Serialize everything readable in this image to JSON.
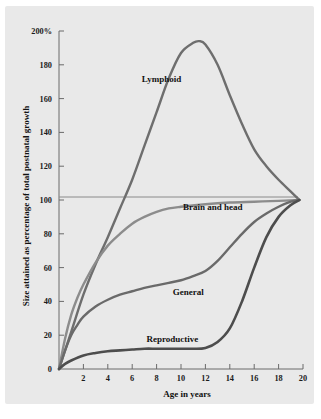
{
  "figure": {
    "background_color": "#e9e9e9",
    "axis_color": "#6a6a6a",
    "reference_line_value": 100
  },
  "chart_data": {
    "type": "line",
    "title": "",
    "xlabel": "Age in years",
    "ylabel": "Size attained as percentage of total postnatal growth",
    "xlim": [
      0,
      20
    ],
    "ylim": [
      0,
      200
    ],
    "grid": false,
    "legend_position": "inline-labels",
    "x_tick_labels": [
      "2",
      "4",
      "6",
      "8",
      "10",
      "12",
      "14",
      "16",
      "18",
      "20"
    ],
    "x_tick_values": [
      2,
      4,
      6,
      8,
      10,
      12,
      14,
      16,
      18,
      20
    ],
    "y_tick_labels": [
      "0",
      "20",
      "40",
      "60",
      "80",
      "100",
      "120",
      "140",
      "160",
      "180",
      "200%"
    ],
    "y_tick_values": [
      0,
      20,
      40,
      60,
      80,
      100,
      120,
      140,
      160,
      180,
      200
    ],
    "annotations": [
      {
        "text": "Lymphoid",
        "x": 8.4,
        "y": 170
      },
      {
        "text": "Brain and head",
        "x": 12.6,
        "y": 94
      },
      {
        "text": "General",
        "x": 10.6,
        "y": 44
      },
      {
        "text": "Reproductive",
        "x": 9.3,
        "y": 16
      }
    ],
    "series": [
      {
        "name": "Lymphoid",
        "color": "#6e6e6e",
        "x": [
          0,
          1,
          2,
          3,
          4,
          5,
          6,
          7,
          8,
          9,
          10,
          11,
          11.5,
          12,
          13,
          14,
          15,
          16,
          17,
          18,
          19,
          19.7
        ],
        "values": [
          0,
          22,
          44,
          62,
          78,
          95,
          112,
          132,
          152,
          172,
          187,
          193,
          194,
          192,
          180,
          162,
          145,
          130,
          120,
          112,
          105,
          100
        ]
      },
      {
        "name": "Brain and head",
        "color": "#8c8c8c",
        "x": [
          0,
          0.5,
          1,
          1.5,
          2,
          3,
          4,
          5,
          6,
          7,
          8,
          9,
          10,
          12,
          14,
          16,
          18,
          19.7
        ],
        "values": [
          0,
          18,
          32,
          42,
          50,
          63,
          73,
          80,
          86,
          90,
          93,
          95,
          96,
          97.5,
          98.5,
          99,
          99.5,
          100
        ]
      },
      {
        "name": "General",
        "color": "#6a6a6a",
        "x": [
          0,
          0.5,
          1,
          1.5,
          2,
          3,
          4,
          5,
          6,
          7,
          8,
          9,
          10,
          11,
          12,
          13,
          14,
          15,
          16,
          17,
          18,
          19,
          19.7
        ],
        "values": [
          0,
          11,
          20,
          26,
          31,
          37,
          41,
          44,
          46,
          48,
          49.5,
          51,
          52.5,
          55,
          58,
          64,
          72,
          80,
          87,
          92,
          96,
          99,
          100
        ]
      },
      {
        "name": "Reproductive",
        "color": "#4d4d4d",
        "x": [
          0,
          0.5,
          1,
          2,
          3,
          4,
          5,
          6,
          7,
          8,
          9,
          10,
          11,
          12,
          13,
          14,
          15,
          16,
          17,
          18,
          19,
          19.7
        ],
        "values": [
          0,
          3,
          5,
          8,
          9.5,
          10.5,
          11,
          11.5,
          12,
          12,
          12,
          12,
          12,
          12.5,
          16,
          24,
          40,
          60,
          78,
          90,
          97,
          100
        ]
      }
    ]
  }
}
